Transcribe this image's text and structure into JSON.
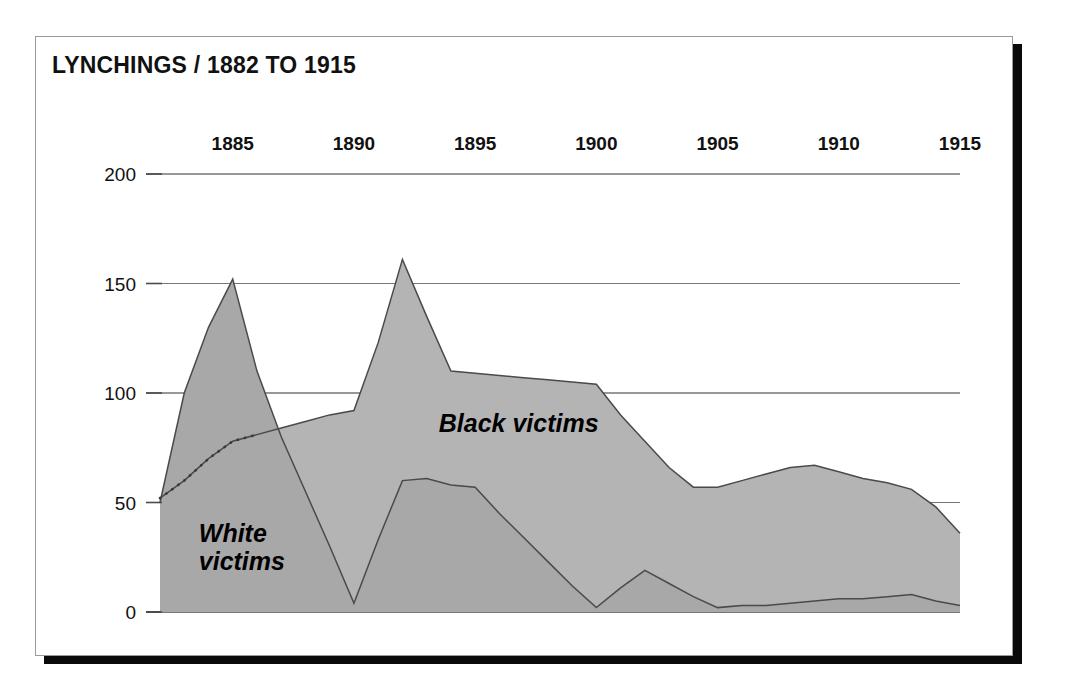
{
  "figure": {
    "title": "LYNCHINGS / 1882 TO 1915",
    "card_background": "#ffffff",
    "shadow_color": "#0a0a0a",
    "border_color": "#9a9a9a"
  },
  "chart_data": {
    "type": "area",
    "title": "LYNCHINGS / 1882 TO 1915",
    "xlabel": "",
    "ylabel": "",
    "xlim": [
      1882,
      1915
    ],
    "ylim": [
      0,
      200
    ],
    "grid": true,
    "gridlines_y": [
      0,
      50,
      100,
      150,
      200
    ],
    "legend_position": "inline-annotation",
    "x_tick_labels": [
      "1885",
      "1890",
      "1895",
      "1900",
      "1905",
      "1910",
      "1915"
    ],
    "x_ticks": [
      1885,
      1890,
      1895,
      1900,
      1905,
      1910,
      1915
    ],
    "y_tick_labels": [
      "0",
      "50",
      "100",
      "150",
      "200"
    ],
    "y_ticks": [
      0,
      50,
      100,
      150,
      200
    ],
    "x": [
      1882,
      1883,
      1884,
      1885,
      1886,
      1887,
      1888,
      1889,
      1890,
      1891,
      1892,
      1893,
      1894,
      1895,
      1896,
      1897,
      1898,
      1899,
      1900,
      1901,
      1902,
      1903,
      1904,
      1905,
      1906,
      1907,
      1908,
      1909,
      1910,
      1911,
      1912,
      1913,
      1914,
      1915
    ],
    "series": [
      {
        "name": "Black victims",
        "label": "Black victims",
        "color": "#b4b4b4",
        "stroke": "#4a4a4a",
        "values": [
          52,
          60,
          70,
          78,
          81,
          84,
          87,
          90,
          92,
          123,
          161,
          135,
          110,
          109,
          108,
          107,
          106,
          105,
          104,
          90,
          78,
          66,
          57,
          57,
          60,
          63,
          66,
          67,
          64,
          61,
          59,
          56,
          48,
          36
        ]
      },
      {
        "name": "White victims",
        "label": "White victims",
        "color": "#a8a8a8",
        "stroke": "#4a4a4a",
        "values": [
          50,
          100,
          130,
          152,
          110,
          80,
          55,
          30,
          4,
          33,
          60,
          61,
          58,
          57,
          45,
          34,
          23,
          12,
          2,
          11,
          19,
          13,
          7,
          2,
          3,
          3,
          4,
          5,
          6,
          6,
          7,
          8,
          5,
          3
        ]
      }
    ],
    "annotations": [
      {
        "text": "Black victims",
        "x": 1893.5,
        "y": 82
      },
      {
        "text": "White victims",
        "x": 1883.6,
        "y": 32
      }
    ],
    "hidden_segment": {
      "series": "Black victims",
      "style": "dotted",
      "from_x": 1882,
      "to_x": 1886,
      "note": "Black victims line shown as dotted where hidden beneath White victims area"
    }
  }
}
